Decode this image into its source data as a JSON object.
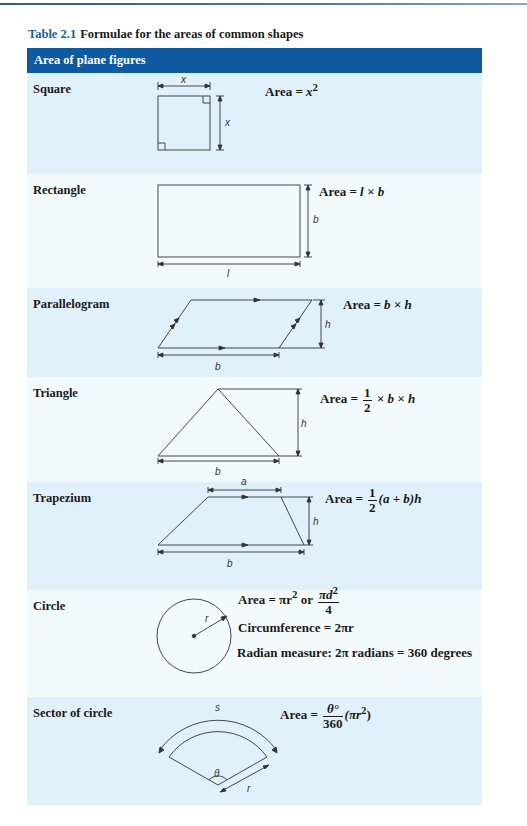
{
  "caption": {
    "number": "Table 2.1",
    "title": "Formulae for the areas of common shapes"
  },
  "header": "Area of plane figures",
  "rows": [
    {
      "name": "Square",
      "formula": {
        "prefix": "Area =",
        "expr": "x",
        "sup": "2"
      },
      "diagram_labels": {
        "top": "x",
        "side": "x"
      }
    },
    {
      "name": "Rectangle",
      "formula": {
        "prefix": "Area =",
        "expr": "l × b"
      },
      "diagram_labels": {
        "bottom": "l",
        "side": "b"
      }
    },
    {
      "name": "Parallelogram",
      "formula": {
        "prefix": "Area =",
        "expr": "b × h"
      },
      "diagram_labels": {
        "bottom": "b",
        "side": "h"
      }
    },
    {
      "name": "Triangle",
      "formula": {
        "prefix": "Area =",
        "frac_num": "1",
        "frac_den": "2",
        "expr": "× b × h"
      },
      "diagram_labels": {
        "bottom": "b",
        "side": "h"
      }
    },
    {
      "name": "Trapezium",
      "formula": {
        "prefix": "Area =",
        "frac_num": "1",
        "frac_den": "2",
        "expr": "(a + b)h"
      },
      "diagram_labels": {
        "top": "a",
        "bottom": "b",
        "side": "h"
      }
    },
    {
      "name": "Circle",
      "formula": {
        "area_prefix": "Area = πr",
        "area_sup": "2",
        "or": "or",
        "frac_num": "πd",
        "frac_num_sup": "2",
        "frac_den": "4",
        "circumference": "Circumference = 2πr",
        "radian": "Radian measure: 2π radians = 360 degrees"
      },
      "diagram_labels": {
        "radius": "r"
      }
    },
    {
      "name": "Sector of circle",
      "formula": {
        "prefix": "Area =",
        "frac_num": "θ°",
        "frac_den": "360",
        "expr": "(πr",
        "sup": "2",
        "close": ")"
      },
      "diagram_labels": {
        "arc": "s",
        "angle": "θ",
        "radius": "r"
      }
    }
  ]
}
